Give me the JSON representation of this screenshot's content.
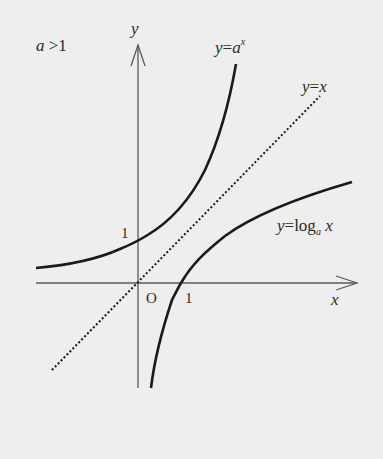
{
  "diagram": {
    "condition": "a > 1",
    "condition_parts": {
      "var": "a",
      "op": ">",
      "val": "1"
    },
    "axes": {
      "x_label": "x",
      "y_label": "y",
      "origin_label": "O",
      "x_tick_label": "1",
      "y_tick_label": "1"
    },
    "curves": [
      {
        "name": "exponential",
        "label_prefix": "y",
        "label_eq": "=",
        "label_base": "a",
        "label_sup": "x",
        "style": "solid"
      },
      {
        "name": "identity",
        "label_prefix": "y",
        "label_eq": "=",
        "label_rhs": "x",
        "style": "dotted"
      },
      {
        "name": "logarithm",
        "label_prefix": "y",
        "label_eq": "=",
        "label_fn": "log",
        "label_sub": "a",
        "label_arg": "x",
        "style": "solid"
      }
    ],
    "colors": {
      "background": "#eeeeee",
      "curve": "#1a1a1a",
      "axis": "#555555",
      "text": "#2a2a2a"
    }
  }
}
